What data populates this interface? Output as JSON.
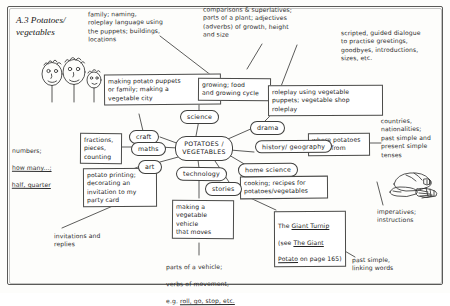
{
  "page": {
    "title": "A.3 Potatoes/\nvegetables",
    "type": "mind-map"
  },
  "hub": {
    "label": "POTATOES /\nVEGETABLES"
  },
  "subjects": [
    {
      "id": "craft",
      "label": "craft"
    },
    {
      "id": "science",
      "label": "science"
    },
    {
      "id": "drama",
      "label": "drama"
    },
    {
      "id": "maths",
      "label": "maths"
    },
    {
      "id": "history",
      "label": "history/\ngeography"
    },
    {
      "id": "art",
      "label": "art"
    },
    {
      "id": "tech",
      "label": "technology"
    },
    {
      "id": "home",
      "label": "home science"
    },
    {
      "id": "stories",
      "label": "stories"
    }
  ],
  "activities": [
    {
      "id": "puppets",
      "text": "making potato puppets\nor family; making a\nvegetable city"
    },
    {
      "id": "growing",
      "text": "growing; food\nand growing cycle"
    },
    {
      "id": "roleplay",
      "text": "roleplay using vegetable\npuppets; vegetable shop\nroleplay"
    },
    {
      "id": "fractions",
      "text": "fractions,\npieces,\ncounting"
    },
    {
      "id": "origin",
      "text": "where potatoes\ncome from"
    },
    {
      "id": "printing",
      "text": "potato printing;\ndecorating an\ninvitation to my\nparty card"
    },
    {
      "id": "vehicle",
      "text": "making a\nvegetable vehicle\nthat moves"
    },
    {
      "id": "cooking",
      "text": "cooking; recipes for\npotatoes/vegetables"
    }
  ],
  "story_box": {
    "line1_pre": "The ",
    "line1_underlined": "Giant Turnip",
    "line2_pre": "(see ",
    "line2_underlined": "The Giant",
    "line3_underlined": "Potato",
    "line3_post": " on page 165)"
  },
  "language_notes": [
    {
      "id": "family",
      "text": "family; naming,\nroleplay language using\nthe puppets; buildings,\nlocations"
    },
    {
      "id": "comparisons",
      "text": "comparisons & superlatives;\nparts of a plant; adjectives\n(adverbs) of growth, height\nand size"
    },
    {
      "id": "dialogue",
      "text": "scripted, guided dialogue\nto practise greetings,\ngoodbyes, introductions,\nsizes, etc."
    },
    {
      "id": "countries",
      "text": "countries,\nnationalities;\npast simple and\npresent simple\ntenses"
    },
    {
      "id": "imperatives",
      "text": "imperatives;\ninstructions"
    },
    {
      "id": "pastsimple",
      "text": "past simple,\nlinking words"
    },
    {
      "id": "invitations",
      "text": "invitations and\nreplies"
    }
  ],
  "numbers_note": {
    "line1": "numbers;",
    "line2_underlined": "how many...;",
    "line3_underlined": "half, quarter"
  },
  "vehicle_note": {
    "line1": "parts of a vehicle;",
    "line2": "verbs of movement,",
    "line3_pre": "e.g. ",
    "line3_underlined": "roll, go, stop, etc."
  },
  "illustrations": [
    {
      "id": "potato-puppets-drawing",
      "desc": "three potato-head puppets on sticks"
    },
    {
      "id": "potato-food-drawing",
      "desc": "cooked potatoes and chips on a plate"
    }
  ],
  "colors": {
    "ink": "#2b2b2b",
    "paper": "#fdfdfb",
    "border": "#4a4a48"
  }
}
